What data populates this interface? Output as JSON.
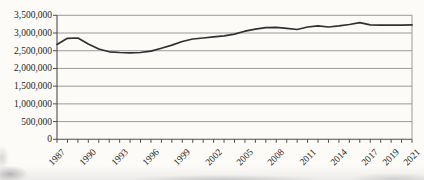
{
  "figure": {
    "background_color": "#fcfbf8",
    "line_color": "#303034",
    "grid_color": "#8f8f8f",
    "axis_color": "#4c4c50",
    "text_color": "#1e1e20"
  },
  "chart_data": {
    "type": "line",
    "title": "",
    "xlabel": "",
    "ylabel": "",
    "legend": "none",
    "grid": "horizontal",
    "x": [
      1987,
      1988,
      1989,
      1990,
      1991,
      1992,
      1993,
      1994,
      1995,
      1996,
      1997,
      1998,
      1999,
      2000,
      2001,
      2002,
      2003,
      2004,
      2005,
      2006,
      2007,
      2008,
      2009,
      2010,
      2011,
      2012,
      2013,
      2014,
      2015,
      2016,
      2017,
      2018,
      2019,
      2020,
      2021
    ],
    "values": [
      2680000,
      2850000,
      2860000,
      2690000,
      2550000,
      2470000,
      2450000,
      2440000,
      2450000,
      2490000,
      2570000,
      2660000,
      2760000,
      2830000,
      2860000,
      2890000,
      2920000,
      2970000,
      3050000,
      3110000,
      3150000,
      3160000,
      3130000,
      3100000,
      3170000,
      3200000,
      3170000,
      3200000,
      3240000,
      3290000,
      3230000,
      3220000,
      3220000,
      3220000,
      3230000
    ],
    "ylim": [
      0,
      3500000
    ],
    "ytick_interval": 500000,
    "ytick_labels": [
      "0",
      "500,000",
      "1,000,000",
      "1,500,000",
      "2,000,000",
      "2,500,000",
      "3,000,000",
      "3,500,000"
    ],
    "xtick_labels_visible": [
      "1987",
      "1990",
      "1993",
      "1996",
      "1999",
      "2002",
      "2005",
      "2008",
      "2011",
      "2014",
      "2017",
      "2019",
      "2021"
    ]
  }
}
